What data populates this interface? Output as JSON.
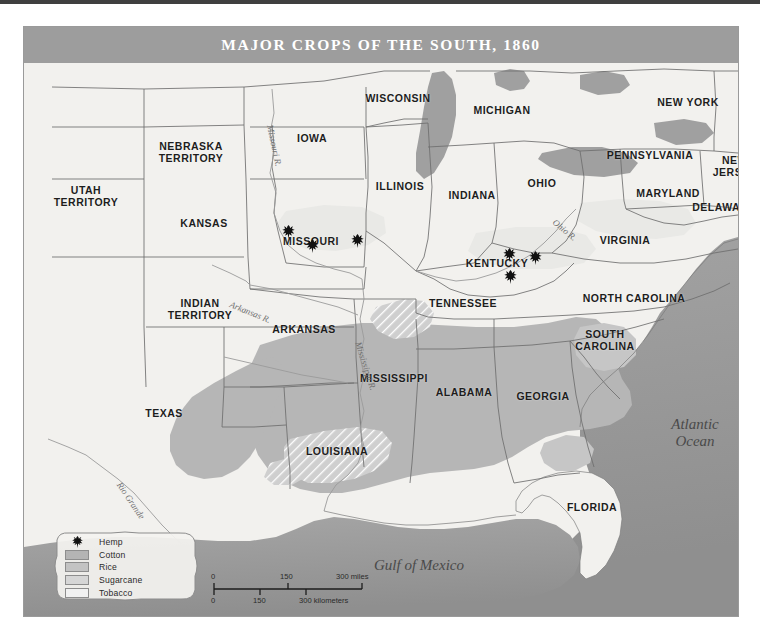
{
  "map": {
    "title": "MAJOR CROPS OF THE SOUTH, 1860",
    "colors": {
      "banner": "#9d9d9d",
      "land": "#f2f1ee",
      "ocean": "#9a9a9a",
      "cotton": "#b4b4b4",
      "rice": "#c8c8c8",
      "sugarcane": "#d8d8d8",
      "tobacco": "#efefef",
      "border": "#6e6e6e",
      "label": "#1d1d1d"
    },
    "states": [
      {
        "name": "WISCONSIN",
        "x": 374,
        "y": 72
      },
      {
        "name": "MICHIGAN",
        "x": 478,
        "y": 84
      },
      {
        "name": "NEW YORK",
        "x": 664,
        "y": 76
      },
      {
        "name": "IOWA",
        "x": 288,
        "y": 112
      },
      {
        "name": "PENNSYLVANIA",
        "x": 626,
        "y": 129
      },
      {
        "name": "NEBRASKA\nTERRITORY",
        "x": 167,
        "y": 125
      },
      {
        "name": "ILLINOIS",
        "x": 376,
        "y": 160
      },
      {
        "name": "INDIANA",
        "x": 448,
        "y": 169
      },
      {
        "name": "OHIO",
        "x": 518,
        "y": 157
      },
      {
        "name": "NEW\nJERSEY",
        "x": 711,
        "y": 139
      },
      {
        "name": "MARYLAND",
        "x": 644,
        "y": 167
      },
      {
        "name": "DELAWARE",
        "x": 700,
        "y": 181
      },
      {
        "name": "UTAH\nTERRITORY",
        "x": 62,
        "y": 169
      },
      {
        "name": "KANSAS",
        "x": 180,
        "y": 197
      },
      {
        "name": "MISSOURI",
        "x": 287,
        "y": 215
      },
      {
        "name": "KENTUCKY",
        "x": 473,
        "y": 237
      },
      {
        "name": "VIRGINIA",
        "x": 601,
        "y": 214
      },
      {
        "name": "INDIAN\nTERRITORY",
        "x": 176,
        "y": 282
      },
      {
        "name": "TENNESSEE",
        "x": 439,
        "y": 277
      },
      {
        "name": "NORTH CAROLINA",
        "x": 610,
        "y": 272
      },
      {
        "name": "ARKANSAS",
        "x": 280,
        "y": 303
      },
      {
        "name": "SOUTH\nCAROLINA",
        "x": 581,
        "y": 313
      },
      {
        "name": "MISSISSIPPI",
        "x": 370,
        "y": 352
      },
      {
        "name": "ALABAMA",
        "x": 440,
        "y": 366
      },
      {
        "name": "GEORGIA",
        "x": 519,
        "y": 370
      },
      {
        "name": "TEXAS",
        "x": 140,
        "y": 387
      },
      {
        "name": "LOUISIANA",
        "x": 313,
        "y": 425
      },
      {
        "name": "FLORIDA",
        "x": 568,
        "y": 481
      }
    ],
    "water_labels": [
      {
        "name": "Atlantic\nOcean",
        "x": 671,
        "y": 406
      },
      {
        "name": "Gulf of Mexico",
        "x": 395,
        "y": 538
      }
    ],
    "rivers": [
      {
        "name": "Missouri R.",
        "x": 246,
        "y": 93,
        "rotate": 78
      },
      {
        "name": "Arkansas R.",
        "x": 206,
        "y": 272,
        "rotate": 22
      },
      {
        "name": "Mississippi R.",
        "x": 334,
        "y": 310,
        "rotate": 72
      },
      {
        "name": "Ohio R.",
        "x": 530,
        "y": 189,
        "rotate": 40
      },
      {
        "name": "Rio Grande",
        "x": 95,
        "y": 451,
        "rotate": 56
      }
    ],
    "hemp_markers": [
      {
        "x": 264,
        "y": 205
      },
      {
        "x": 288,
        "y": 219
      },
      {
        "x": 333,
        "y": 214
      },
      {
        "x": 485,
        "y": 228
      },
      {
        "x": 511,
        "y": 231
      },
      {
        "x": 486,
        "y": 250
      }
    ]
  },
  "legend": {
    "items": [
      {
        "label": "Hemp",
        "key": "hemp-leaf-icon",
        "color": null
      },
      {
        "label": "Cotton",
        "key": "swatch",
        "color": "#b4b4b4"
      },
      {
        "label": "Rice",
        "key": "swatch",
        "color": "#c3c3c3"
      },
      {
        "label": "Sugarcane",
        "key": "swatch",
        "color": "#d6d6d6"
      },
      {
        "label": "Tobacco",
        "key": "swatch",
        "color": "#f1f1f1"
      }
    ]
  },
  "scalebar": {
    "miles_ticks": [
      "0",
      "150",
      "300 miles"
    ],
    "kilometers_ticks": [
      "0",
      "150",
      "300 kilometers"
    ]
  }
}
